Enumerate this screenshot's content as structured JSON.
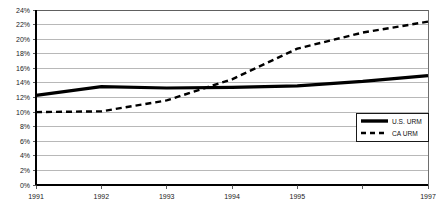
{
  "chart_data": {
    "type": "line",
    "title": "",
    "subtitle": "",
    "xlabel": "",
    "ylabel": "",
    "x": [
      1991,
      1992,
      1993,
      1994,
      1995,
      1996,
      1997
    ],
    "categories": [
      "1991",
      "1992",
      "1993",
      "1994",
      "1995",
      "1996",
      "1997"
    ],
    "xtick_labels": [
      "1991",
      "1992",
      "1993",
      "1994",
      "1995",
      "",
      "1997"
    ],
    "ytick_labels": [
      "0%",
      "2%",
      "4%",
      "6%",
      "8%",
      "10%",
      "12%",
      "14%",
      "16%",
      "18%",
      "20%",
      "22%",
      "24%"
    ],
    "ytick_values": [
      0,
      2,
      4,
      6,
      8,
      10,
      12,
      14,
      16,
      18,
      20,
      22,
      24
    ],
    "ylim": [
      0,
      24
    ],
    "xlim": [
      1991,
      1997
    ],
    "grid": true,
    "grid_axis": "y",
    "legend_position": "lower-right",
    "series": [
      {
        "name": "U.S. URM",
        "style": "solid",
        "color": "#000000",
        "values": [
          12.3,
          13.5,
          13.3,
          13.4,
          13.6,
          14.2,
          15.0
        ]
      },
      {
        "name": "CA URM",
        "style": "dashed",
        "color": "#000000",
        "values": [
          10.0,
          10.1,
          11.6,
          14.5,
          18.7,
          20.9,
          22.4
        ]
      }
    ]
  },
  "legend": {
    "entries": [
      {
        "label": "U.S. URM",
        "style": "solid"
      },
      {
        "label": "CA URM",
        "style": "dashed"
      }
    ]
  },
  "axes": {
    "y_axis_name": "percent-axis",
    "x_axis_name": "year-axis"
  }
}
